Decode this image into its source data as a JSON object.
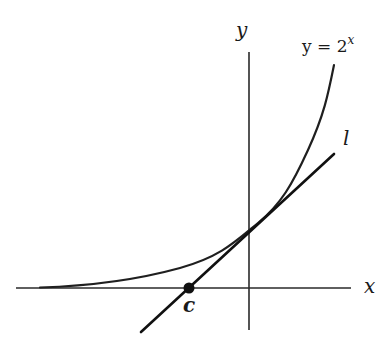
{
  "figure": {
    "axes": {
      "x_label": "x",
      "y_label": "y"
    },
    "curve": {
      "label_lhs": "y = 2",
      "label_exp": "x",
      "equation": "y = 2^x"
    },
    "tangent_line": {
      "label": "l"
    },
    "point": {
      "label": "c",
      "description": "x-intercept of tangent line l"
    },
    "colors": {
      "ink": "#1a1a1a",
      "background": "#ffffff"
    }
  }
}
